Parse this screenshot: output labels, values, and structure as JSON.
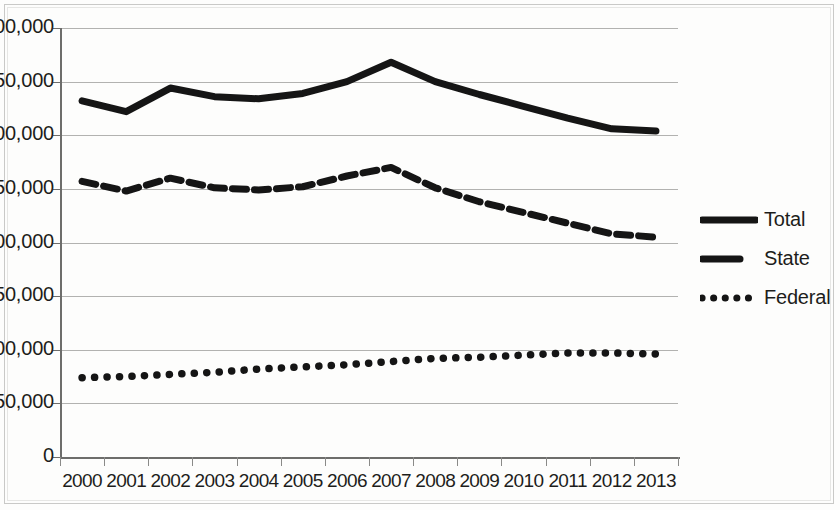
{
  "chart_data": {
    "type": "line",
    "title": "",
    "subtitle": "",
    "xlabel": "",
    "ylabel": "",
    "categories": [
      "2000",
      "2001",
      "2002",
      "2003",
      "2004",
      "2005",
      "2006",
      "2007",
      "2008",
      "2009",
      "2010",
      "2011",
      "2012",
      "2013"
    ],
    "series": [
      {
        "name": "Total",
        "style": "solid",
        "color": "#151515",
        "values": [
          332000,
          322000,
          344000,
          336000,
          334000,
          339000,
          350000,
          368000,
          350000,
          338000,
          327000,
          316000,
          306000,
          304000
        ]
      },
      {
        "name": "State",
        "style": "dashed",
        "color": "#151515",
        "values": [
          257000,
          248000,
          260000,
          251000,
          249000,
          252000,
          262000,
          270000,
          251000,
          238000,
          228000,
          218000,
          208000,
          205000
        ]
      },
      {
        "name": "Federal",
        "style": "dotted",
        "color": "#151515",
        "values": [
          74000,
          75000,
          77000,
          79000,
          82000,
          84000,
          86000,
          89000,
          92000,
          93000,
          95000,
          97000,
          97000,
          96000
        ]
      }
    ],
    "ylim": [
      0,
      400000
    ],
    "ytick_values": [
      0,
      50000,
      100000,
      150000,
      200000,
      250000,
      300000,
      350000,
      400000
    ],
    "ytick_labels": [
      "0",
      "50,000",
      "1,00,000",
      "1,50,000",
      "2,00,000",
      "2,50,000",
      "3,00,000",
      "3,50,000",
      "4,00,000"
    ],
    "grid": true,
    "grid_axis": "y",
    "legend_position": "right",
    "legend_entries": [
      "Total",
      "State",
      "Federal"
    ]
  }
}
